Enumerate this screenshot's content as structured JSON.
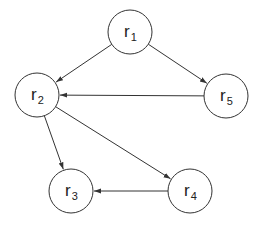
{
  "diagram": {
    "type": "directed-graph",
    "colors": {
      "stroke": "#333333",
      "node_fill": "#ffffff",
      "text": "#222222"
    },
    "node_radius": 22,
    "nodes": [
      {
        "id": "r1",
        "base": "r",
        "sub": "1",
        "cx": 130,
        "cy": 32
      },
      {
        "id": "r2",
        "base": "r",
        "sub": "2",
        "cx": 37,
        "cy": 95
      },
      {
        "id": "r3",
        "base": "r",
        "sub": "3",
        "cx": 71,
        "cy": 191
      },
      {
        "id": "r4",
        "base": "r",
        "sub": "4",
        "cx": 190,
        "cy": 191
      },
      {
        "id": "r5",
        "base": "r",
        "sub": "5",
        "cx": 226,
        "cy": 96
      }
    ],
    "edges": [
      {
        "from": "r1",
        "to": "r2"
      },
      {
        "from": "r1",
        "to": "r5"
      },
      {
        "from": "r5",
        "to": "r2"
      },
      {
        "from": "r2",
        "to": "r3"
      },
      {
        "from": "r2",
        "to": "r4"
      },
      {
        "from": "r4",
        "to": "r3"
      }
    ]
  }
}
